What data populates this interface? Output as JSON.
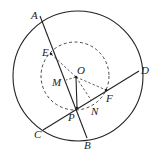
{
  "labels": {
    "A": "A",
    "B": "B",
    "C": "C",
    "D": "D",
    "E": "E",
    "O": "O",
    "M": "M",
    "F": "F",
    "P": "P",
    "N": "N"
  },
  "colors": {
    "stroke": "#222222",
    "background": "#ffffff"
  }
}
